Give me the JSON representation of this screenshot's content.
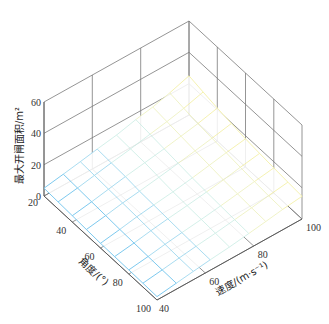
{
  "chart_data": {
    "type": "surface3d",
    "title": "",
    "xlabel": "角度/(°)",
    "ylabel": "速度/(m·s⁻¹)",
    "zlabel": "最大开闸面积/m²",
    "x_axis": {
      "label": "角度/(°)",
      "ticks": [
        20,
        40,
        60,
        80,
        100
      ],
      "range": [
        20,
        100
      ]
    },
    "y_axis": {
      "label": "速度/(m·s⁻¹)",
      "ticks": [
        40,
        60,
        80,
        100
      ],
      "range": [
        40,
        100
      ]
    },
    "z_axis": {
      "label": "最大开闸面积/m²",
      "ticks": [
        0,
        20,
        40,
        60
      ],
      "range": [
        0,
        60
      ]
    },
    "grid": true,
    "colormap": [
      "#6ec3ec",
      "#9fd8ee",
      "#cfeee6",
      "#eef2c2",
      "#f4f0a8"
    ],
    "surface": {
      "angle": [
        20,
        30,
        40,
        50,
        60,
        70,
        80,
        90,
        100
      ],
      "speed": [
        40,
        48,
        55,
        62,
        70,
        78,
        85,
        92,
        100
      ],
      "z_description": "Max gate opening area rises with speed and falls with angle; approx 2 m² at (angle 100, speed 40) up to approx 25 m² at (angle 20, speed 100)",
      "z": [
        [
          5,
          7,
          9,
          11,
          13,
          16,
          18,
          21,
          25
        ],
        [
          4.5,
          6.5,
          8.5,
          10.5,
          12.5,
          15,
          17,
          19.5,
          23
        ],
        [
          4,
          6,
          8,
          10,
          12,
          14,
          16,
          18,
          21
        ],
        [
          3.5,
          5.5,
          7.5,
          9,
          11,
          13,
          15,
          17,
          19.5
        ],
        [
          3,
          5,
          7,
          8.5,
          10,
          12,
          14,
          16,
          18
        ],
        [
          2.8,
          4.6,
          6.4,
          8,
          9.5,
          11.3,
          13,
          15,
          17
        ],
        [
          2.6,
          4.3,
          6,
          7.5,
          9,
          10.7,
          12.4,
          14.2,
          16
        ],
        [
          2.4,
          4,
          5.6,
          7,
          8.5,
          10.2,
          11.8,
          13.5,
          15.2
        ],
        [
          2.2,
          3.8,
          5.3,
          6.7,
          8,
          9.7,
          11.3,
          13,
          14.5
        ]
      ]
    }
  }
}
